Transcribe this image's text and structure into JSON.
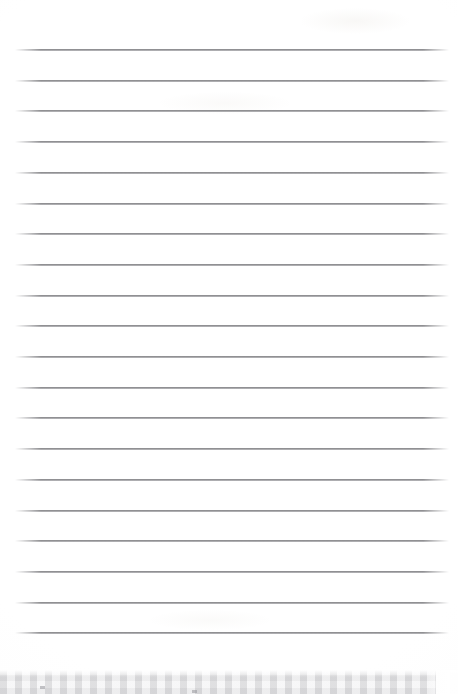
{
  "document": {
    "type": "scanned-lined-paper",
    "title": "Blank ruled notebook page",
    "page_width": 458,
    "page_height": 694,
    "paper_color": "#ffffff",
    "has_visible_text": false,
    "text_content": "",
    "handwriting_present": false
  },
  "ruling": {
    "line_color": "#787878",
    "line_thickness": 2,
    "line_count": 20,
    "left_x": 15,
    "right_x": 449,
    "first_line_y": 50,
    "spacing": 30.7,
    "lines_y": [
      50,
      80.7,
      111.4,
      142.1,
      172.8,
      203.5,
      234.2,
      264.9,
      295.6,
      326.3,
      357.0,
      387.7,
      418.4,
      449.1,
      479.8,
      510.5,
      541.2,
      571.9,
      602.6,
      633.3
    ],
    "margin_rule_present": false
  },
  "scan_edge": {
    "band_label": "scanner-edge-texture",
    "band_top_y": 670,
    "band_height": 24,
    "band_color": "#eeeeef",
    "pattern": "checker-halftone",
    "right_cutoff_x": 436
  },
  "artifacts": {
    "smudges": [
      {
        "name": "top-right-smudge",
        "x": 300,
        "y": 8,
        "w": 110,
        "h": 26
      },
      {
        "name": "upper-mid-smudge",
        "x": 160,
        "y": 92,
        "w": 130,
        "h": 22
      },
      {
        "name": "lower-mid-smudge",
        "x": 150,
        "y": 610,
        "w": 120,
        "h": 20
      }
    ],
    "specks": [
      {
        "name": "band-speck-1",
        "x": 40,
        "y": 686
      },
      {
        "name": "band-speck-2",
        "x": 192,
        "y": 690
      }
    ]
  }
}
